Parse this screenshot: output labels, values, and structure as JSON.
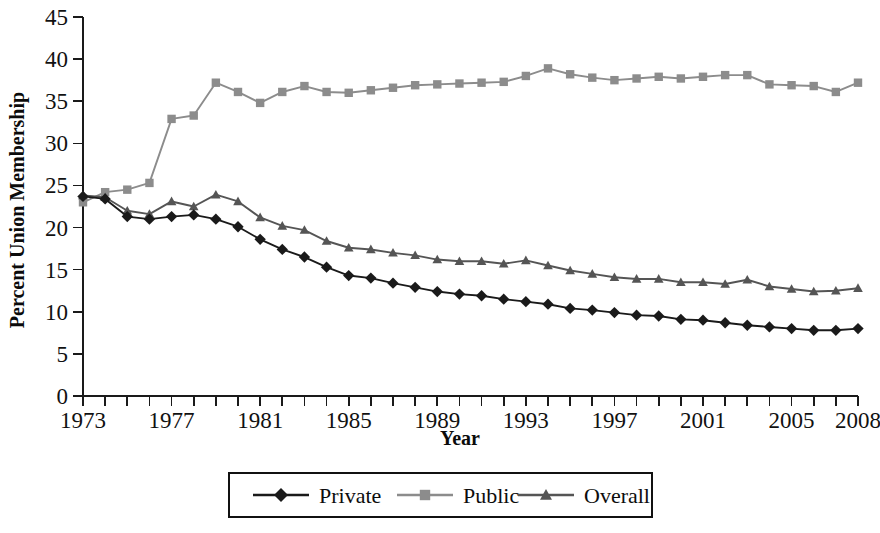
{
  "chart_data": {
    "type": "line",
    "title": "",
    "xlabel": "Year",
    "ylabel": "Percent Union Membership",
    "xlim": [
      1973,
      2008
    ],
    "ylim": [
      0,
      45
    ],
    "ytick_step": 5,
    "xtick_step": 1,
    "xlabel_step": 4,
    "grid": false,
    "legend_position": "bottom",
    "ytick_labels": [
      "0",
      "5",
      "10",
      "15",
      "20",
      "25",
      "30",
      "35",
      "40",
      "45"
    ],
    "xtick_labels": [
      "1973",
      "1977",
      "1981",
      "1985",
      "1989",
      "1993",
      "1997",
      "2001",
      "2005",
      "2008"
    ],
    "x": [
      1973,
      1974,
      1975,
      1976,
      1977,
      1978,
      1979,
      1980,
      1981,
      1982,
      1983,
      1984,
      1985,
      1986,
      1987,
      1988,
      1989,
      1990,
      1991,
      1992,
      1993,
      1994,
      1995,
      1996,
      1997,
      1998,
      1999,
      2000,
      2001,
      2002,
      2003,
      2004,
      2005,
      2006,
      2007,
      2008
    ],
    "series": [
      {
        "name": "Private",
        "marker": "diamond",
        "color": "#1a1a1a",
        "values": [
          23.7,
          23.4,
          21.3,
          21.0,
          21.3,
          21.5,
          21.0,
          20.1,
          18.6,
          17.4,
          16.5,
          15.3,
          14.3,
          14.0,
          13.4,
          12.9,
          12.4,
          12.1,
          11.9,
          11.5,
          11.2,
          10.9,
          10.4,
          10.2,
          9.9,
          9.6,
          9.5,
          9.1,
          9.0,
          8.7,
          8.4,
          8.2,
          8.0,
          7.8,
          7.8,
          8.0
        ]
      },
      {
        "name": "Public",
        "marker": "square",
        "color": "#8c8c8c",
        "values": [
          23.0,
          24.2,
          24.5,
          25.3,
          32.9,
          33.3,
          37.2,
          36.1,
          34.8,
          36.1,
          36.8,
          36.1,
          36.0,
          36.3,
          36.6,
          36.9,
          37.0,
          37.1,
          37.2,
          37.3,
          38.0,
          38.9,
          38.2,
          37.8,
          37.5,
          37.7,
          37.9,
          37.7,
          37.9,
          38.1,
          38.1,
          37.0,
          36.9,
          36.8,
          36.1,
          37.2
        ]
      },
      {
        "name": "Overall",
        "marker": "triangle",
        "color": "#555555",
        "values": [
          23.8,
          23.6,
          22.0,
          21.6,
          23.1,
          22.5,
          23.9,
          23.1,
          21.2,
          20.2,
          19.7,
          18.4,
          17.6,
          17.4,
          17.0,
          16.7,
          16.2,
          16.0,
          16.0,
          15.7,
          16.1,
          15.5,
          14.9,
          14.5,
          14.1,
          13.9,
          13.9,
          13.5,
          13.5,
          13.3,
          13.8,
          13.0,
          12.7,
          12.4,
          12.5,
          12.8
        ]
      }
    ],
    "legend_entries": [
      {
        "label": "Private",
        "marker": "diamond",
        "color": "#1a1a1a"
      },
      {
        "label": "Public",
        "marker": "square",
        "color": "#8c8c8c"
      },
      {
        "label": "Overall",
        "marker": "triangle",
        "color": "#555555"
      }
    ]
  }
}
